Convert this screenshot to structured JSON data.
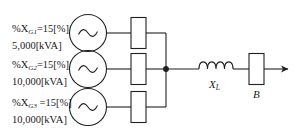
{
  "diagram": {
    "generators": [
      {
        "id": "G1",
        "reactance_text": "%X",
        "reactance_subscript": "G1",
        "reactance_value": "=15[%]",
        "rating": "5,000[kVA]",
        "symbol": "ac-source"
      },
      {
        "id": "G2",
        "reactance_text": "%X",
        "reactance_subscript": "G2",
        "reactance_value": "=15[%]",
        "rating": "10,000[kVA]",
        "symbol": "ac-source"
      },
      {
        "id": "G3",
        "reactance_text": "%X",
        "reactance_subscript": "G3",
        "reactance_value": " =15[%]",
        "rating": "10,000[kVA]",
        "symbol": "ac-source"
      }
    ],
    "line_reactance": {
      "label": "X",
      "subscript": "L",
      "symbol": "inductor-coil",
      "coil_loops": 4
    },
    "load_bus": {
      "label": "B",
      "symbol": "rectangle-element"
    },
    "colors": {
      "background": "#ffffff",
      "stroke": "#231f20",
      "text": "#1a1a1a"
    }
  }
}
